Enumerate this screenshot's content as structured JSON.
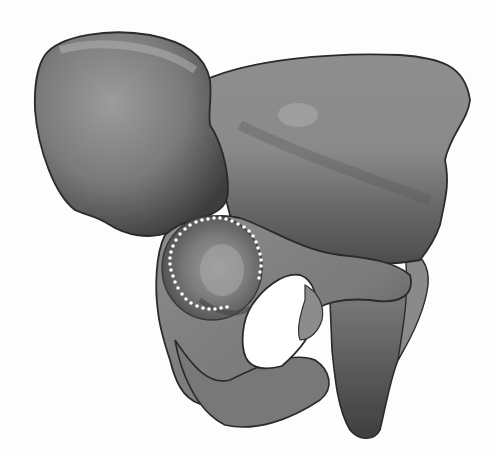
{
  "figure": {
    "style": "grayscale shaded illustration",
    "background": "#fdfdfd",
    "colors": {
      "bone_light": "#a8a8a8",
      "bone_mid": "#8a8a8a",
      "bone_dark": "#4a4a4a",
      "outline": "#2a2a2a",
      "foramen": "#ffffff",
      "marker_dots": "#ffffff"
    },
    "regions": [
      {
        "name": "ilium-wing-left",
        "label": ""
      },
      {
        "name": "ilium-wing-right",
        "label": ""
      },
      {
        "name": "acetabulum",
        "label": "",
        "marker": "dotted-outline"
      },
      {
        "name": "obturator-foramen",
        "label": ""
      },
      {
        "name": "ischium",
        "label": ""
      },
      {
        "name": "pubis",
        "label": ""
      }
    ]
  }
}
